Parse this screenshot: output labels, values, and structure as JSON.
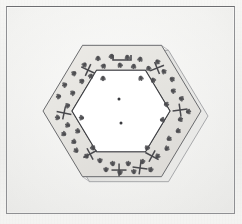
{
  "figure": {
    "kind": "line-engraving",
    "background_color": "#f0f0ee",
    "frame": {
      "name": "plate-border",
      "line_color": "#6d6e71",
      "x": 6,
      "y": 6,
      "width": 229,
      "height": 208
    },
    "hexagon": {
      "outer": {
        "center_x": 122,
        "center_y": 111,
        "radius": 79,
        "orientation": "flat-top",
        "stroke_color": "#55565a",
        "fill_color": "#e7e7e4"
      },
      "inner": {
        "center_x": 121,
        "center_y": 111,
        "radius": 49,
        "stroke_color": "#3a3b3f",
        "fill_color": "#ffffff"
      },
      "depth": {
        "offset_x": 7,
        "offset_y": 5,
        "side_face_color": "#dedede",
        "edge_color": "#7d7e82"
      }
    },
    "band_texture": {
      "mark_color": "#4a4a4e",
      "mark_kind": "insect-trefoil",
      "mark_count": 64,
      "vertex_marks": 6,
      "vertex_mark_kind": "cross"
    },
    "center_dots": [
      {
        "x": 119,
        "y": 99,
        "r": 1.5
      },
      {
        "x": 121,
        "y": 123,
        "r": 1.5
      }
    ],
    "marks": [
      {
        "x": 98,
        "y": 56,
        "rot": 0,
        "type": "trefoil"
      },
      {
        "x": 112,
        "y": 54,
        "rot": 12,
        "type": "trefoil"
      },
      {
        "x": 127,
        "y": 55,
        "rot": -8,
        "type": "trefoil"
      },
      {
        "x": 141,
        "y": 57,
        "rot": 20,
        "type": "trefoil"
      },
      {
        "x": 105,
        "y": 64,
        "rot": 35,
        "type": "trefoil"
      },
      {
        "x": 119,
        "y": 63,
        "rot": -25,
        "type": "trefoil"
      },
      {
        "x": 134,
        "y": 64,
        "rot": 8,
        "type": "trefoil"
      },
      {
        "x": 148,
        "y": 66,
        "rot": -15,
        "type": "trefoil"
      },
      {
        "x": 86,
        "y": 63,
        "rot": 40,
        "type": "trefoil"
      },
      {
        "x": 156,
        "y": 60,
        "rot": -40,
        "type": "trefoil"
      },
      {
        "x": 76,
        "y": 72,
        "rot": 55,
        "type": "trefoil"
      },
      {
        "x": 84,
        "y": 80,
        "rot": 60,
        "type": "trefoil"
      },
      {
        "x": 67,
        "y": 84,
        "rot": 70,
        "type": "trefoil"
      },
      {
        "x": 75,
        "y": 92,
        "rot": 65,
        "type": "trefoil"
      },
      {
        "x": 61,
        "y": 96,
        "rot": 80,
        "type": "trefoil"
      },
      {
        "x": 70,
        "y": 105,
        "rot": 75,
        "type": "trefoil"
      },
      {
        "x": 60,
        "y": 118,
        "rot": 100,
        "type": "trefoil"
      },
      {
        "x": 70,
        "y": 126,
        "rot": 110,
        "type": "trefoil"
      },
      {
        "x": 66,
        "y": 135,
        "rot": 118,
        "type": "trefoil"
      },
      {
        "x": 76,
        "y": 143,
        "rot": 122,
        "type": "trefoil"
      },
      {
        "x": 78,
        "y": 152,
        "rot": 130,
        "type": "trefoil"
      },
      {
        "x": 88,
        "y": 158,
        "rot": 140,
        "type": "trefoil"
      },
      {
        "x": 100,
        "y": 163,
        "rot": 178,
        "type": "trefoil"
      },
      {
        "x": 113,
        "y": 166,
        "rot": 172,
        "type": "trefoil"
      },
      {
        "x": 128,
        "y": 166,
        "rot": 186,
        "type": "trefoil"
      },
      {
        "x": 142,
        "y": 164,
        "rot": 192,
        "type": "trefoil"
      },
      {
        "x": 106,
        "y": 172,
        "rot": 180,
        "type": "trefoil"
      },
      {
        "x": 120,
        "y": 175,
        "rot": 180,
        "type": "trefoil"
      },
      {
        "x": 134,
        "y": 174,
        "rot": 176,
        "type": "trefoil"
      },
      {
        "x": 150,
        "y": 172,
        "rot": 196,
        "type": "trefoil"
      },
      {
        "x": 156,
        "y": 158,
        "rot": 222,
        "type": "trefoil"
      },
      {
        "x": 165,
        "y": 150,
        "rot": 230,
        "type": "trefoil"
      },
      {
        "x": 167,
        "y": 140,
        "rot": 238,
        "type": "trefoil"
      },
      {
        "x": 176,
        "y": 132,
        "rot": 242,
        "type": "trefoil"
      },
      {
        "x": 178,
        "y": 120,
        "rot": 255,
        "type": "trefoil"
      },
      {
        "x": 186,
        "y": 112,
        "rot": 262,
        "type": "trefoil"
      },
      {
        "x": 179,
        "y": 98,
        "rot": 285,
        "type": "trefoil"
      },
      {
        "x": 171,
        "y": 90,
        "rot": 292,
        "type": "trefoil"
      },
      {
        "x": 170,
        "y": 78,
        "rot": 300,
        "type": "trefoil"
      },
      {
        "x": 162,
        "y": 70,
        "rot": 308,
        "type": "trefoil"
      },
      {
        "x": 92,
        "y": 74,
        "rot": 30,
        "type": "trefoil"
      },
      {
        "x": 103,
        "y": 76,
        "rot": 0,
        "type": "trefoil"
      },
      {
        "x": 140,
        "y": 76,
        "rot": -20,
        "type": "trefoil"
      },
      {
        "x": 152,
        "y": 78,
        "rot": -30,
        "type": "trefoil"
      },
      {
        "x": 84,
        "y": 118,
        "rot": 95,
        "type": "trefoil"
      },
      {
        "x": 80,
        "y": 132,
        "rot": 112,
        "type": "trefoil"
      },
      {
        "x": 160,
        "y": 120,
        "rot": 265,
        "type": "trefoil"
      },
      {
        "x": 164,
        "y": 104,
        "rot": 278,
        "type": "trefoil"
      },
      {
        "x": 94,
        "y": 150,
        "rot": 152,
        "type": "trefoil"
      },
      {
        "x": 146,
        "y": 150,
        "rot": 208,
        "type": "trefoil"
      }
    ],
    "crosses": [
      {
        "x": 64,
        "y": 113,
        "rot": 12
      },
      {
        "x": 180,
        "y": 110,
        "rot": -8
      },
      {
        "x": 88,
        "y": 70,
        "rot": 25
      },
      {
        "x": 157,
        "y": 68,
        "rot": -22
      },
      {
        "x": 90,
        "y": 154,
        "rot": -28
      },
      {
        "x": 152,
        "y": 156,
        "rot": 28
      },
      {
        "x": 119,
        "y": 170,
        "rot": 0
      },
      {
        "x": 140,
        "y": 168,
        "rot": 8
      }
    ],
    "brackets": [
      {
        "x": 122,
        "y": 58,
        "rot": 0
      }
    ]
  }
}
